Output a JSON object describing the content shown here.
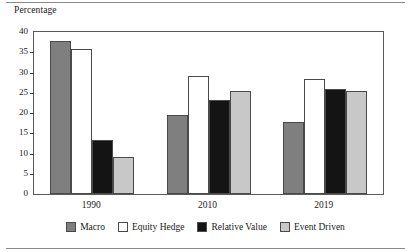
{
  "figure": {
    "axis_title": "Percentage"
  },
  "chart_data": {
    "type": "bar",
    "title": "",
    "subtitle": "",
    "xlabel": "",
    "ylabel": "Percentage",
    "categories": [
      "1990",
      "2010",
      "2019"
    ],
    "series": [
      {
        "name": "Macro",
        "color": "#7f7f7f",
        "values": [
          37.8,
          19.6,
          17.8
        ]
      },
      {
        "name": "Equity Hedge",
        "color": "#ffffff",
        "values": [
          35.7,
          29.1,
          28.3
        ]
      },
      {
        "name": "Relative Value",
        "color": "#141414",
        "values": [
          13.3,
          23.2,
          26.0
        ]
      },
      {
        "name": "Event Driven",
        "color": "#c8c8c8",
        "values": [
          9.1,
          25.4,
          25.5
        ]
      }
    ],
    "ylim": [
      0,
      40
    ],
    "yticks": [
      0,
      5,
      10,
      15,
      20,
      25,
      30,
      35,
      40
    ],
    "ytick_labels": [
      "0",
      "5",
      "10",
      "15",
      "20",
      "25",
      "30",
      "35",
      "40"
    ],
    "grid": false,
    "legend_position": "bottom",
    "legend_entries": [
      "Macro",
      "Equity Hedge",
      "Relative Value",
      "Event Driven"
    ]
  }
}
